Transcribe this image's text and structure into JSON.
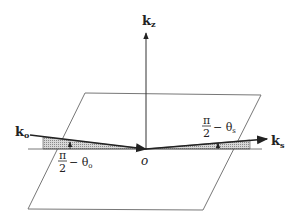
{
  "diagram": {
    "labels": {
      "kz": "k",
      "kz_sub": "z",
      "k0": "k",
      "k0_sub": "o",
      "ks": "k",
      "ks_sub": "s",
      "origin": "o",
      "angle_left_num": "π",
      "angle_left_den": "2",
      "angle_left_rest": "− θ",
      "angle_left_sub": "o",
      "angle_right_num": "π",
      "angle_right_den": "2",
      "angle_right_rest": "− θ",
      "angle_right_sub": "s"
    },
    "colors": {
      "line": "#333333",
      "plane": "#777777",
      "hatch": "#aaaaaa"
    }
  }
}
